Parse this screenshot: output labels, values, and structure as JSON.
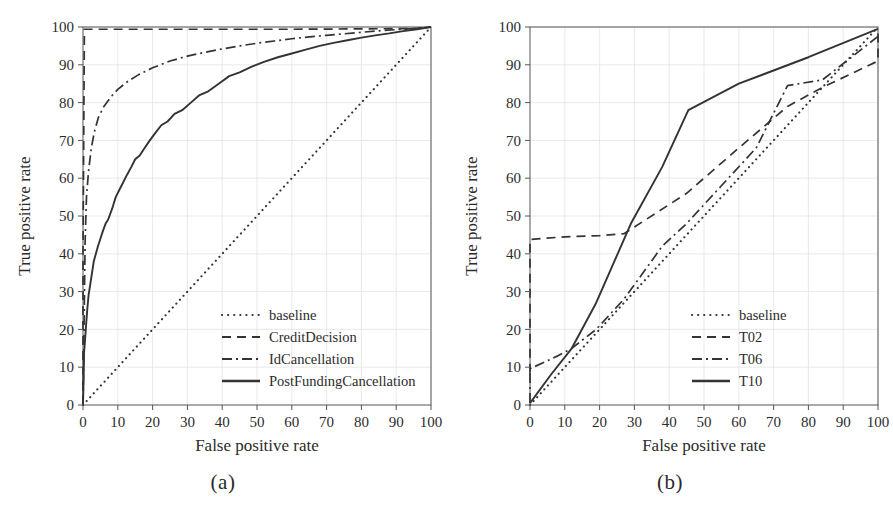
{
  "figure": {
    "panels": [
      {
        "caption": "(a)",
        "xlabel": "False positive rate",
        "ylabel": "True positive rate",
        "xticks": [
          0,
          10,
          20,
          30,
          40,
          50,
          60,
          70,
          80,
          90,
          100
        ],
        "yticks": [
          0,
          10,
          20,
          30,
          40,
          50,
          60,
          70,
          80,
          90,
          100
        ],
        "legend": [
          {
            "label": "baseline",
            "style": "dotted"
          },
          {
            "label": "CreditDecision",
            "style": "dashed"
          },
          {
            "label": "IdCancellation",
            "style": "dashdot"
          },
          {
            "label": "PostFundingCancellation",
            "style": "solid"
          }
        ]
      },
      {
        "caption": "(b)",
        "xlabel": "False positive rate",
        "ylabel": "True positive rate",
        "xticks": [
          0,
          10,
          20,
          30,
          40,
          50,
          60,
          70,
          80,
          90,
          100
        ],
        "yticks": [
          0,
          10,
          20,
          30,
          40,
          50,
          60,
          70,
          80,
          90,
          100
        ],
        "legend": [
          {
            "label": "baseline",
            "style": "dotted"
          },
          {
            "label": "T02",
            "style": "dashed"
          },
          {
            "label": "T06",
            "style": "dashdot"
          },
          {
            "label": "T10",
            "style": "solid"
          }
        ]
      }
    ]
  },
  "chart_data": [
    {
      "type": "line",
      "title": "(a)",
      "xlabel": "False positive rate",
      "ylabel": "True positive rate",
      "xlim": [
        0,
        100
      ],
      "ylim": [
        0,
        100
      ],
      "grid": true,
      "legend_position": "lower right",
      "series": [
        {
          "name": "baseline",
          "style": "dotted",
          "points": [
            [
              0,
              0
            ],
            [
              10,
              10
            ],
            [
              20,
              20
            ],
            [
              30,
              30
            ],
            [
              40,
              40
            ],
            [
              50,
              50
            ],
            [
              60,
              60
            ],
            [
              70,
              70
            ],
            [
              80,
              80
            ],
            [
              90,
              90
            ],
            [
              100,
              100
            ]
          ]
        },
        {
          "name": "CreditDecision",
          "style": "dashed",
          "points": [
            [
              0,
              0
            ],
            [
              0,
              40
            ],
            [
              0.4,
              99.4
            ],
            [
              20,
              99.4
            ],
            [
              40,
              99.4
            ],
            [
              60,
              99.4
            ],
            [
              80,
              99.5
            ],
            [
              95,
              99.6
            ],
            [
              100,
              100
            ]
          ]
        },
        {
          "name": "IdCancellation",
          "style": "dashdot",
          "points": [
            [
              0,
              0
            ],
            [
              0.3,
              20
            ],
            [
              0.6,
              43
            ],
            [
              1.0,
              55
            ],
            [
              1.6,
              62
            ],
            [
              2.4,
              68
            ],
            [
              3.2,
              72
            ],
            [
              4.4,
              76
            ],
            [
              6,
              79
            ],
            [
              8,
              81.5
            ],
            [
              10,
              83.5
            ],
            [
              13,
              85.7
            ],
            [
              16,
              87.4
            ],
            [
              20,
              89.2
            ],
            [
              25,
              91
            ],
            [
              30,
              92.3
            ],
            [
              35,
              93.3
            ],
            [
              40,
              94.2
            ],
            [
              45,
              95
            ],
            [
              50,
              95.7
            ],
            [
              55,
              96.3
            ],
            [
              60,
              96.9
            ],
            [
              65,
              97.4
            ],
            [
              70,
              97.8
            ],
            [
              75,
              98.2
            ],
            [
              80,
              98.6
            ],
            [
              85,
              99
            ],
            [
              90,
              99.3
            ],
            [
              95,
              99.6
            ],
            [
              100,
              100
            ]
          ]
        },
        {
          "name": "PostFundingCancellation",
          "style": "solid",
          "points": [
            [
              0,
              0
            ],
            [
              0.2,
              8
            ],
            [
              0.3,
              14
            ],
            [
              0.5,
              16
            ],
            [
              0.8,
              20
            ],
            [
              1.2,
              25
            ],
            [
              1.6,
              29
            ],
            [
              2.1,
              32
            ],
            [
              2.6,
              35
            ],
            [
              3.1,
              38
            ],
            [
              3.7,
              40
            ],
            [
              4.3,
              42
            ],
            [
              5.0,
              44
            ],
            [
              5.7,
              46
            ],
            [
              6.5,
              48
            ],
            [
              7.2,
              49
            ],
            [
              8.4,
              52
            ],
            [
              9.4,
              55
            ],
            [
              10.5,
              57
            ],
            [
              11.6,
              59
            ],
            [
              12.7,
              61
            ],
            [
              13.9,
              63
            ],
            [
              15.0,
              65
            ],
            [
              16.3,
              66
            ],
            [
              17.7,
              68
            ],
            [
              19.2,
              70
            ],
            [
              20.8,
              72
            ],
            [
              22.5,
              74
            ],
            [
              24.3,
              75
            ],
            [
              26.3,
              77
            ],
            [
              28.5,
              78
            ],
            [
              31.0,
              80
            ],
            [
              33.5,
              82
            ],
            [
              36.0,
              83
            ],
            [
              39.0,
              85
            ],
            [
              42.0,
              87
            ],
            [
              45.0,
              88
            ],
            [
              48.5,
              89.5
            ],
            [
              52.0,
              90.8
            ],
            [
              56.0,
              92
            ],
            [
              60.0,
              93
            ],
            [
              64.0,
              94
            ],
            [
              68.0,
              95
            ],
            [
              72.0,
              95.8
            ],
            [
              76.0,
              96.5
            ],
            [
              80.0,
              97.2
            ],
            [
              84.0,
              97.8
            ],
            [
              88.0,
              98.3
            ],
            [
              92.0,
              98.9
            ],
            [
              96.0,
              99.4
            ],
            [
              100,
              100
            ]
          ]
        }
      ]
    },
    {
      "type": "line",
      "title": "(b)",
      "xlabel": "False positive rate",
      "ylabel": "True positive rate",
      "xlim": [
        0,
        100
      ],
      "ylim": [
        0,
        100
      ],
      "grid": true,
      "legend_position": "lower right",
      "series": [
        {
          "name": "baseline",
          "style": "dotted",
          "points": [
            [
              0,
              0
            ],
            [
              10,
              10
            ],
            [
              20,
              20
            ],
            [
              30,
              30
            ],
            [
              40,
              40
            ],
            [
              50,
              50
            ],
            [
              60,
              60
            ],
            [
              70,
              70
            ],
            [
              80,
              80
            ],
            [
              90,
              90
            ],
            [
              100,
              100
            ]
          ]
        },
        {
          "name": "T02",
          "style": "dashed",
          "points": [
            [
              0,
              8.5
            ],
            [
              0,
              43.8
            ],
            [
              10,
              44.5
            ],
            [
              20,
              44.8
            ],
            [
              27,
              45.3
            ],
            [
              45,
              56
            ],
            [
              60,
              68
            ],
            [
              74,
              79
            ],
            [
              84,
              84
            ],
            [
              100,
              91
            ],
            [
              100,
              99.5
            ]
          ]
        },
        {
          "name": "T06",
          "style": "dashdot",
          "points": [
            [
              0,
              0.5
            ],
            [
              0,
              9.6
            ],
            [
              8,
              13
            ],
            [
              12,
              15
            ],
            [
              19,
              20
            ],
            [
              27,
              28
            ],
            [
              38,
              42
            ],
            [
              45,
              48
            ],
            [
              55,
              58
            ],
            [
              65,
              68
            ],
            [
              74,
              84.5
            ],
            [
              84,
              86
            ],
            [
              100,
              97.5
            ]
          ]
        },
        {
          "name": "T10",
          "style": "solid",
          "points": [
            [
              0,
              0.5
            ],
            [
              6,
              8
            ],
            [
              12,
              15
            ],
            [
              19,
              27
            ],
            [
              29,
              48
            ],
            [
              38,
              63
            ],
            [
              45.5,
              78
            ],
            [
              60,
              85
            ],
            [
              80,
              92
            ],
            [
              100,
              99.5
            ]
          ]
        }
      ]
    }
  ]
}
